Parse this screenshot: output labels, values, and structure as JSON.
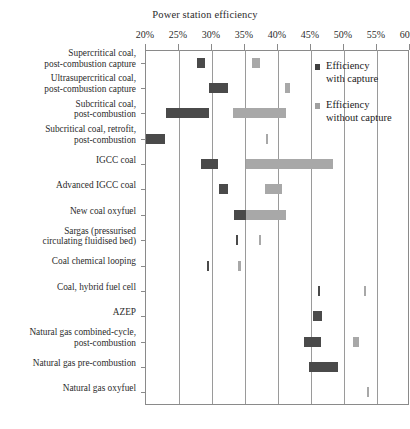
{
  "chart_data": {
    "type": "bar",
    "orientation": "horizontal",
    "title": "Power station efficiency",
    "xlabel": "",
    "ylabel": "",
    "xlim": [
      20,
      60
    ],
    "xunit": "%",
    "grid": true,
    "gridlines_at": [
      25,
      30,
      35,
      40,
      45,
      50,
      55
    ],
    "tick_labels": [
      "20%",
      "25%",
      "30%",
      "35%",
      "40%",
      "45%",
      "50%",
      "55%",
      "60%"
    ],
    "tick_values": [
      20,
      25,
      30,
      35,
      40,
      45,
      50,
      55,
      60
    ],
    "legend_position": "inside-right-top",
    "legend": [
      {
        "name": "Efficiency with capture",
        "color": "#4a4a4a"
      },
      {
        "name": "Efficiency without capture",
        "color": "#a8a8a8"
      }
    ],
    "categories": [
      "Supercritical coal, post-combustion capture",
      "Ultrasupercritical coal, post-combustion capture",
      "Subcritical coal, post-combustion",
      "Subcritical coal, retrofit, post-combustion",
      "IGCC coal",
      "Advanced IGCC coal",
      "New coal oxyfuel",
      "Sargas (pressurised circulating fluidised bed)",
      "Coal chemical looping",
      "Coal, hybrid fuel cell",
      "AZEP",
      "Natural gas combined-cycle, post-combustion",
      "Natural gas pre-combustion",
      "Natural gas oxyfuel"
    ],
    "rows": [
      {
        "label_lines": [
          "Supercritical coal,",
          "post-combustion capture"
        ],
        "with_capture": {
          "min": 27.7,
          "max": 28.9
        },
        "without_capture": {
          "min": 36.0,
          "max": 37.2
        }
      },
      {
        "label_lines": [
          "Ultrasupercritical coal,",
          "post-combustion capture"
        ],
        "with_capture": {
          "min": 29.5,
          "max": 32.5
        },
        "without_capture": {
          "min": 41.0,
          "max": 41.8
        }
      },
      {
        "label_lines": [
          "Subcritical coal,",
          "post-combustion"
        ],
        "with_capture": {
          "min": 23.0,
          "max": 29.5
        },
        "without_capture": {
          "min": 33.2,
          "max": 41.2
        }
      },
      {
        "label_lines": [
          "Subcritical coal, retrofit,",
          "post-combustion"
        ],
        "with_capture": {
          "min": 20.0,
          "max": 22.9
        },
        "without_capture": {
          "min": 38.2,
          "max": 38.5
        }
      },
      {
        "label_lines": [
          "IGCC coal"
        ],
        "with_capture": {
          "min": 28.3,
          "max": 30.9
        },
        "without_capture": {
          "min": 35.1,
          "max": 48.4
        }
      },
      {
        "label_lines": [
          "Advanced IGCC coal"
        ],
        "with_capture": {
          "min": 31.0,
          "max": 32.4
        },
        "without_capture": {
          "min": 38.1,
          "max": 40.6
        }
      },
      {
        "label_lines": [
          "New coal oxyfuel"
        ],
        "with_capture": {
          "min": 33.3,
          "max": 35.2
        },
        "without_capture": {
          "min": 35.2,
          "max": 41.2
        }
      },
      {
        "label_lines": [
          "Sargas (pressurised",
          "circulating fluidised bed)"
        ],
        "with_capture": {
          "min": 33.6,
          "max": 33.9
        },
        "without_capture": {
          "min": 37.1,
          "max": 37.4
        }
      },
      {
        "label_lines": [
          "Coal chemical looping"
        ],
        "with_capture": {
          "min": 29.2,
          "max": 29.5
        },
        "without_capture": {
          "min": 34.0,
          "max": 34.3
        }
      },
      {
        "label_lines": [
          "Coal, hybrid fuel cell"
        ],
        "with_capture": {
          "min": 46.0,
          "max": 46.3
        },
        "without_capture": {
          "min": 53.0,
          "max": 53.3
        }
      },
      {
        "label_lines": [
          "AZEP"
        ],
        "with_capture": {
          "min": 45.3,
          "max": 46.7
        },
        "without_capture": null
      },
      {
        "label_lines": [
          "Natural gas combined-cycle,",
          "post-combustion"
        ],
        "with_capture": {
          "min": 43.9,
          "max": 46.5
        },
        "without_capture": {
          "min": 51.4,
          "max": 52.2
        }
      },
      {
        "label_lines": [
          "Natural gas pre-combustion"
        ],
        "with_capture": {
          "min": 44.7,
          "max": 49.1
        },
        "without_capture": null
      },
      {
        "label_lines": [
          "Natural gas oxyfuel"
        ],
        "with_capture": null,
        "without_capture": {
          "min": 53.5,
          "max": 53.8
        }
      }
    ]
  }
}
